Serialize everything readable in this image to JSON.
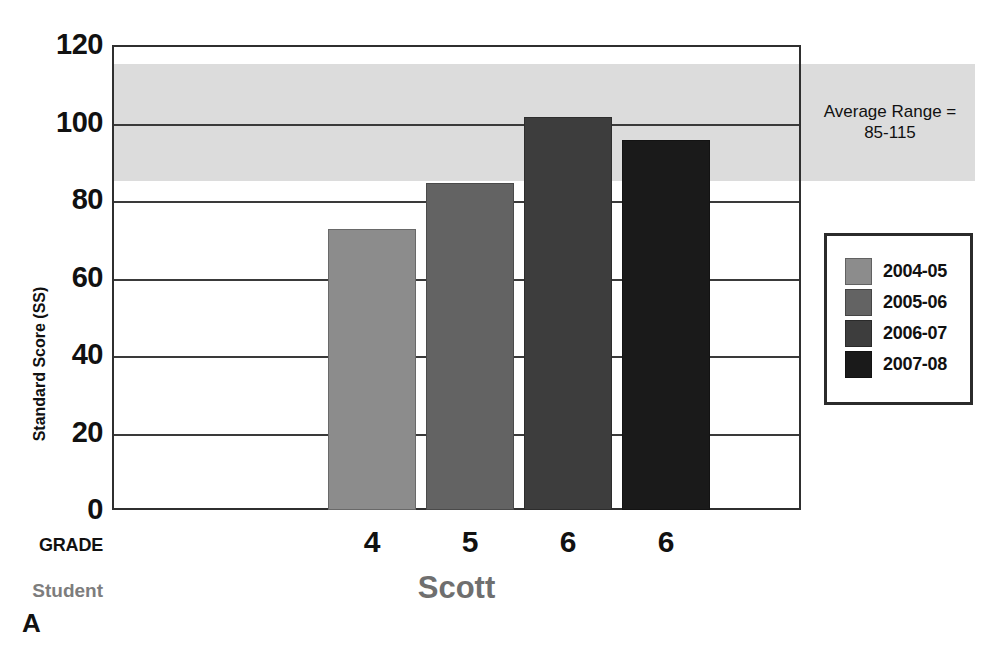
{
  "chart_data": {
    "type": "bar",
    "title": "",
    "subtitle": "",
    "xlabel": "GRADE",
    "ylabel": "Standard Score (SS)",
    "categories": [
      "4",
      "5",
      "6",
      "6"
    ],
    "series": [
      {
        "name": "2004-05",
        "category": "4",
        "value": 73,
        "color": "#8c8c8c"
      },
      {
        "name": "2005-06",
        "category": "5",
        "value": 85,
        "color": "#636363"
      },
      {
        "name": "2006-07",
        "category": "6",
        "value": 102,
        "color": "#3d3d3d"
      },
      {
        "name": "2007-08",
        "category": "6",
        "value": 96,
        "color": "#1a1a1a"
      }
    ],
    "values": [
      73,
      85,
      102,
      96
    ],
    "ylim": [
      0,
      120
    ],
    "yticks": [
      0,
      20,
      40,
      60,
      80,
      100,
      120
    ],
    "ytick_labels": [
      "0",
      "20",
      "40",
      "60",
      "80",
      "100",
      "120"
    ],
    "grid": true,
    "grid_axis": "y",
    "legend_position": "right",
    "legend_entries": [
      "2004-05",
      "2005-06",
      "2006-07",
      "2007-08"
    ],
    "annotations": [
      {
        "name": "average-range-band",
        "text": "Average Range =\n85-115",
        "y_low": 85,
        "y_high": 115,
        "color": "#dcdcdc"
      }
    ],
    "panel_label": "A",
    "group_label": "Scott"
  },
  "axes": {
    "y_title": "Standard Score (SS)",
    "y_ticks": [
      {
        "label": "120",
        "value": 120
      },
      {
        "label": "100",
        "value": 100
      },
      {
        "label": "80",
        "value": 80
      },
      {
        "label": "60",
        "value": 60
      },
      {
        "label": "40",
        "value": 40
      },
      {
        "label": "20",
        "value": 20
      },
      {
        "label": "0",
        "value": 0
      }
    ]
  },
  "bars": [
    {
      "label": "2004-05",
      "grade": "4",
      "value": 73,
      "color": "#8c8c8c"
    },
    {
      "label": "2005-06",
      "grade": "5",
      "value": 85,
      "color": "#636363"
    },
    {
      "label": "2006-07",
      "grade": "6",
      "value": 102,
      "color": "#3d3d3d"
    },
    {
      "label": "2007-08",
      "grade": "6",
      "value": 96,
      "color": "#1a1a1a"
    }
  ],
  "legend": {
    "items": [
      {
        "label": "2004-05",
        "color": "#8c8c8c"
      },
      {
        "label": "2005-06",
        "color": "#636363"
      },
      {
        "label": "2006-07",
        "color": "#3d3d3d"
      },
      {
        "label": "2007-08",
        "color": "#1a1a1a"
      }
    ]
  },
  "annotation": {
    "average_range_line1": "Average Range =",
    "average_range_line2": "85-115"
  },
  "labels": {
    "grade_row": "GRADE",
    "student_row": "Student",
    "student_name": "Scott",
    "panel": "A",
    "grades": [
      "4",
      "5",
      "6",
      "6"
    ]
  },
  "colors": {
    "band": "#dcdcdc",
    "axis": "#2f2f2f",
    "grid": "#3a3a3a",
    "student_text": "#6f6f6f"
  }
}
